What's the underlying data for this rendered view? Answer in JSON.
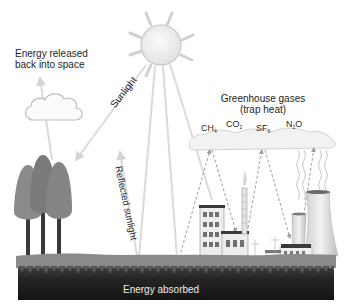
{
  "diagram": {
    "palette": {
      "sky": "#ffffff",
      "sun_fill": "#ededed",
      "sun_stroke": "#cfcfcf",
      "arrow": "#d8d8d8",
      "dashed_arrow": "#a8a8a8",
      "tree": "#7c7c7c",
      "trunk": "#3c3c3c",
      "grass": "#8a8a8a",
      "soil": "#1e1e1e",
      "text": "#1e1e1e"
    },
    "labels": {
      "energy_released_line1": "Energy released",
      "energy_released_line2": "back into space",
      "sunlight": "Sunlight",
      "reflected_sunlight": "Reflected sunlight",
      "greenhouse_line1": "Greenhouse gases",
      "greenhouse_line2": "(trap heat)",
      "energy_absorbed": "Energy absorbed"
    },
    "gases": [
      {
        "base": "CH",
        "sub": "4"
      },
      {
        "base": "CO",
        "sub": "2"
      },
      {
        "base": "SF",
        "sub": "6"
      },
      {
        "base": "N",
        "sub": "2",
        "suffix": "O"
      }
    ],
    "elements": [
      "sun",
      "white cloud",
      "greenhouse gas cloud",
      "trees",
      "factory buildings",
      "smokestack",
      "cooling towers",
      "ground"
    ]
  }
}
